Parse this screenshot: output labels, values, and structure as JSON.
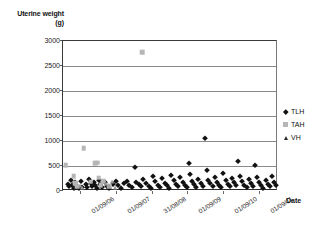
{
  "chart_data": {
    "type": "scatter",
    "title": "",
    "ylabel": "Uterine weight (g)",
    "ylabel_line1": "Uterine weight",
    "ylabel_line2": "(g)",
    "xlabel": "Date",
    "ylim": [
      0,
      3000
    ],
    "yticks": [
      3000,
      2500,
      2000,
      1500,
      1000,
      500,
      0
    ],
    "xticks": [
      "01/09/06",
      "01/09/07",
      "31/08/08",
      "01/09/09",
      "01/09/10",
      "01/09/11"
    ],
    "grid": true,
    "legend_position": "right",
    "colors": {
      "TLH": "#111111",
      "TAH": "#b6b6b6",
      "VH": "#9c9c9c"
    },
    "series": [
      {
        "name": "TLH",
        "marker": "diamond",
        "points": [
          [
            0.022,
            150
          ],
          [
            0.03,
            95
          ],
          [
            0.036,
            215
          ],
          [
            0.044,
            130
          ],
          [
            0.05,
            70
          ],
          [
            0.058,
            175
          ],
          [
            0.066,
            110
          ],
          [
            0.074,
            60
          ],
          [
            0.082,
            200
          ],
          [
            0.09,
            90
          ],
          [
            0.105,
            135
          ],
          [
            0.112,
            75
          ],
          [
            0.12,
            250
          ],
          [
            0.128,
            160
          ],
          [
            0.134,
            105
          ],
          [
            0.142,
            190
          ],
          [
            0.15,
            120
          ],
          [
            0.158,
            65
          ],
          [
            0.166,
            230
          ],
          [
            0.174,
            140
          ],
          [
            0.182,
            85
          ],
          [
            0.196,
            175
          ],
          [
            0.205,
            100
          ],
          [
            0.214,
            55
          ],
          [
            0.232,
            145
          ],
          [
            0.246,
            195
          ],
          [
            0.258,
            115
          ],
          [
            0.268,
            70
          ],
          [
            0.284,
            165
          ],
          [
            0.296,
            205
          ],
          [
            0.308,
            125
          ],
          [
            0.32,
            80
          ],
          [
            0.334,
            480
          ],
          [
            0.34,
            185
          ],
          [
            0.352,
            135
          ],
          [
            0.362,
            95
          ],
          [
            0.374,
            240
          ],
          [
            0.386,
            155
          ],
          [
            0.398,
            105
          ],
          [
            0.408,
            65
          ],
          [
            0.42,
            300
          ],
          [
            0.43,
            195
          ],
          [
            0.44,
            130
          ],
          [
            0.452,
            85
          ],
          [
            0.462,
            265
          ],
          [
            0.474,
            170
          ],
          [
            0.484,
            115
          ],
          [
            0.494,
            70
          ],
          [
            0.504,
            330
          ],
          [
            0.514,
            215
          ],
          [
            0.524,
            150
          ],
          [
            0.534,
            95
          ],
          [
            0.544,
            275
          ],
          [
            0.556,
            185
          ],
          [
            0.566,
            125
          ],
          [
            0.576,
            75
          ],
          [
            0.586,
            560
          ],
          [
            0.592,
            340
          ],
          [
            0.6,
            205
          ],
          [
            0.61,
            140
          ],
          [
            0.62,
            90
          ],
          [
            0.63,
            250
          ],
          [
            0.64,
            165
          ],
          [
            0.65,
            110
          ],
          [
            0.66,
            1060
          ],
          [
            0.668,
            420
          ],
          [
            0.676,
            230
          ],
          [
            0.686,
            155
          ],
          [
            0.696,
            100
          ],
          [
            0.706,
            290
          ],
          [
            0.716,
            185
          ],
          [
            0.726,
            125
          ],
          [
            0.736,
            75
          ],
          [
            0.746,
            355
          ],
          [
            0.756,
            215
          ],
          [
            0.766,
            145
          ],
          [
            0.776,
            95
          ],
          [
            0.786,
            260
          ],
          [
            0.796,
            175
          ],
          [
            0.806,
            115
          ],
          [
            0.816,
            600
          ],
          [
            0.824,
            310
          ],
          [
            0.834,
            195
          ],
          [
            0.844,
            130
          ],
          [
            0.854,
            85
          ],
          [
            0.864,
            245
          ],
          [
            0.874,
            160
          ],
          [
            0.884,
            105
          ],
          [
            0.894,
            520
          ],
          [
            0.902,
            280
          ],
          [
            0.912,
            185
          ],
          [
            0.922,
            120
          ],
          [
            0.932,
            70
          ],
          [
            0.944,
            225
          ],
          [
            0.954,
            150
          ],
          [
            0.964,
            95
          ],
          [
            0.974,
            310
          ],
          [
            0.982,
            190
          ],
          [
            0.99,
            125
          ]
        ]
      },
      {
        "name": "TAH",
        "marker": "square",
        "points": [
          [
            0.012,
            520
          ],
          [
            0.05,
            300
          ],
          [
            0.058,
            155
          ],
          [
            0.066,
            90
          ],
          [
            0.096,
            860
          ],
          [
            0.128,
            185
          ],
          [
            0.15,
            560
          ],
          [
            0.158,
            570
          ],
          [
            0.166,
            270
          ],
          [
            0.176,
            120
          ],
          [
            0.188,
            200
          ],
          [
            0.368,
            2780
          ],
          [
            0.215,
            95
          ]
        ]
      },
      {
        "name": "VH",
        "marker": "triangle",
        "points": [
          [
            0.08,
            110
          ],
          [
            0.088,
            70
          ],
          [
            0.2,
            150
          ],
          [
            0.214,
            95
          ],
          [
            0.228,
            175
          ],
          [
            0.24,
            60
          ]
        ]
      }
    ]
  },
  "legend": {
    "items": [
      {
        "label": "TLH",
        "marker": "diamond"
      },
      {
        "label": "TAH",
        "marker": "square"
      },
      {
        "label": "VH",
        "marker": "triangle"
      }
    ]
  }
}
